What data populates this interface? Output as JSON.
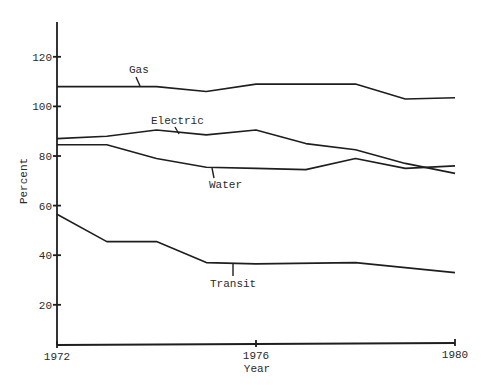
{
  "chart_data": {
    "type": "line",
    "title": "",
    "xlabel": "Year",
    "ylabel": "Percent",
    "x_ticks": [
      "1972",
      "1976",
      "1980"
    ],
    "y_ticks": [
      "20",
      "40",
      "60",
      "80",
      "100",
      "120"
    ],
    "xlim": [
      1972,
      1980
    ],
    "ylim": [
      0,
      135
    ],
    "grid": false,
    "legend": "inline labels",
    "series": [
      {
        "name": "Gas",
        "x": [
          1972,
          1974,
          1975,
          1976,
          1978,
          1979,
          1980
        ],
        "values": [
          108,
          108,
          106,
          109,
          109,
          103,
          103.5
        ]
      },
      {
        "name": "Electric",
        "x": [
          1972,
          1973,
          1974,
          1975,
          1976,
          1977,
          1978,
          1979,
          1980
        ],
        "values": [
          87,
          88,
          90.5,
          88.5,
          90.5,
          85,
          82.5,
          77,
          73
        ]
      },
      {
        "name": "Water",
        "x": [
          1972,
          1973,
          1974,
          1975,
          1976,
          1977,
          1978,
          1979,
          1980
        ],
        "values": [
          84.5,
          84.5,
          79,
          75.5,
          75,
          74.5,
          79,
          75,
          76
        ]
      },
      {
        "name": "Transit",
        "x": [
          1972,
          1973,
          1974,
          1975,
          1976,
          1978,
          1980
        ],
        "values": [
          56.5,
          45.5,
          45.5,
          37,
          36.5,
          37,
          33
        ]
      }
    ]
  }
}
